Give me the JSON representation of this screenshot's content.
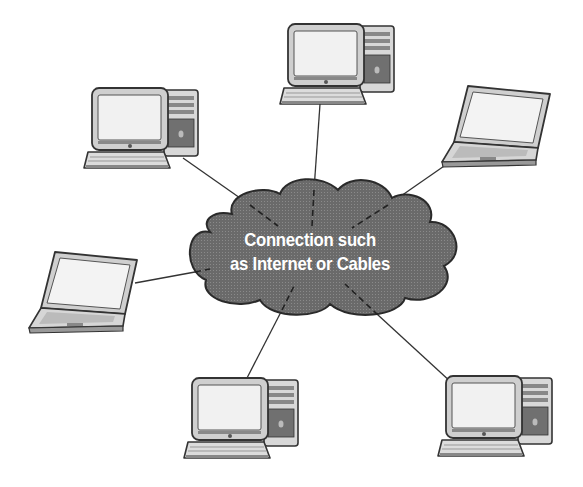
{
  "diagram": {
    "type": "network-star",
    "center": {
      "label_line1": "Connection such",
      "label_line2": "as Internet or Cables",
      "shape": "cloud",
      "fill": "#6b6b6b"
    },
    "nodes": [
      {
        "id": "desktop-top",
        "kind": "desktop-computer"
      },
      {
        "id": "desktop-upper-left",
        "kind": "desktop-computer"
      },
      {
        "id": "laptop-upper-right",
        "kind": "laptop"
      },
      {
        "id": "laptop-left",
        "kind": "laptop"
      },
      {
        "id": "desktop-bottom-center",
        "kind": "desktop-computer"
      },
      {
        "id": "desktop-bottom-right",
        "kind": "desktop-computer"
      }
    ],
    "line_color": "#333333"
  }
}
